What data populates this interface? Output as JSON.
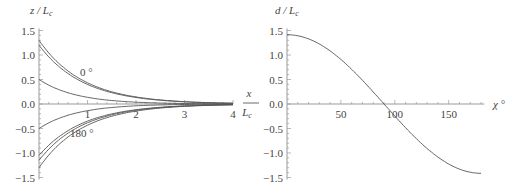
{
  "chart_data": [
    {
      "type": "line",
      "title": "",
      "xlabel": "x / L_c",
      "ylabel": "z / L_c",
      "xlim": [
        0,
        4
      ],
      "ylim": [
        -1.5,
        1.5
      ],
      "x_ticks": [
        1,
        2,
        3,
        4
      ],
      "y_ticks": [
        "1.5",
        "1.0",
        "0.5",
        "0.0",
        "-0.5",
        "-1.0",
        "-1.5"
      ],
      "grid": false,
      "annotations": [
        {
          "text": "0 °",
          "x": 0.85,
          "y": 0.65
        },
        {
          "text": "180 °",
          "x": 0.8,
          "y": -0.6
        }
      ],
      "series": [
        {
          "name": "upper-1",
          "start": 1.3,
          "decay": 1.1
        },
        {
          "name": "upper-2",
          "start": 1.2,
          "decay": 1.1
        },
        {
          "name": "upper-3",
          "start": 0.5,
          "decay": 1.3
        },
        {
          "name": "lower-1",
          "start": -0.5,
          "decay": 1.3
        },
        {
          "name": "lower-2",
          "start": -1.05,
          "decay": 1.1
        },
        {
          "name": "lower-3",
          "start": -1.15,
          "decay": 1.1
        },
        {
          "name": "lower-4",
          "start": -1.3,
          "decay": 1.1
        }
      ]
    },
    {
      "type": "line",
      "title": "",
      "xlabel": "χ °",
      "ylabel": "d / L_c",
      "xlim": [
        0,
        180
      ],
      "ylim": [
        -1.5,
        1.5
      ],
      "x_ticks": [
        50,
        100,
        150
      ],
      "y_ticks": [
        "1.5",
        "1.0",
        "0.5",
        "0.0",
        "-0.5",
        "-1.0",
        "-1.5"
      ],
      "grid": false,
      "series": [
        {
          "name": "d",
          "x": [
            0,
            20,
            40,
            60,
            80,
            90,
            100,
            120,
            140,
            160,
            180
          ],
          "values": [
            1.41,
            1.33,
            1.08,
            0.71,
            0.25,
            0.0,
            -0.25,
            -0.71,
            -1.08,
            -1.33,
            -1.41
          ]
        }
      ]
    }
  ],
  "left": {
    "ylabel": "z / L",
    "ylabel_sub": "c",
    "xlabel_num": "x",
    "xlabel_den": "L",
    "xlabel_den_sub": "c",
    "annot_top": "0 °",
    "annot_bottom": "180 °"
  },
  "right": {
    "ylabel": "d / L",
    "ylabel_sub": "c",
    "xlabel": "χ °"
  },
  "style": {
    "line_color": "#555555",
    "axis_color": "#999999"
  }
}
